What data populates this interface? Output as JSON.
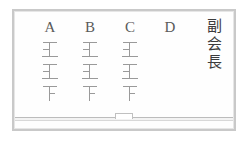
{
  "scene": {
    "kind": "whiteboard",
    "frame_color": "#c9c9c9",
    "board_color": "#fefefe",
    "ink_color": "#9a9a9a",
    "header_color": "#5a5a5a",
    "label_color": "#3c3c3c"
  },
  "tally_board": {
    "columns": [
      {
        "header": "A",
        "marks": [
          {
            "strokes": 4,
            "glyph": "正"
          },
          {
            "strokes": 4,
            "glyph": "正"
          },
          {
            "strokes": 3,
            "glyph": "下"
          }
        ],
        "count": 11
      },
      {
        "header": "B",
        "marks": [
          {
            "strokes": 4,
            "glyph": "正"
          },
          {
            "strokes": 4,
            "glyph": "正"
          },
          {
            "strokes": 3,
            "glyph": "下"
          }
        ],
        "count": 11
      },
      {
        "header": "C",
        "marks": [
          {
            "strokes": 4,
            "glyph": "正"
          },
          {
            "strokes": 4,
            "glyph": "正"
          },
          {
            "strokes": 3,
            "glyph": "下"
          }
        ],
        "count": 11
      },
      {
        "header": "D",
        "marks": [],
        "count": 0
      }
    ]
  },
  "vertical_label": {
    "text": "副会長",
    "chars": [
      "副",
      "会",
      "長"
    ]
  }
}
